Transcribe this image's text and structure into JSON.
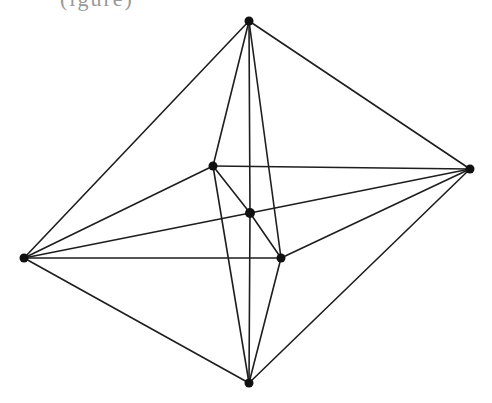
{
  "caption_fragment": "(igure)",
  "colors": {
    "line": "#1e1e1e",
    "vertex": "#111111",
    "background": "#ffffff"
  },
  "graph": {
    "vertices": [
      {
        "id": "top",
        "x": 249,
        "y": 21,
        "r": 4.5
      },
      {
        "id": "right",
        "x": 470,
        "y": 169,
        "r": 4.5
      },
      {
        "id": "left",
        "x": 24,
        "y": 258,
        "r": 4.5
      },
      {
        "id": "bottom",
        "x": 249,
        "y": 383,
        "r": 4.5
      },
      {
        "id": "inner-upper-left",
        "x": 213,
        "y": 166,
        "r": 4.5
      },
      {
        "id": "center",
        "x": 250,
        "y": 213,
        "r": 5
      },
      {
        "id": "inner-lower-right",
        "x": 281,
        "y": 258,
        "r": 4.5
      }
    ],
    "edges": [
      [
        "top",
        "left"
      ],
      [
        "top",
        "right"
      ],
      [
        "bottom",
        "left"
      ],
      [
        "bottom",
        "right"
      ],
      [
        "top",
        "inner-upper-left"
      ],
      [
        "top",
        "center"
      ],
      [
        "top",
        "inner-lower-right"
      ],
      [
        "bottom",
        "inner-upper-left"
      ],
      [
        "bottom",
        "center"
      ],
      [
        "bottom",
        "inner-lower-right"
      ],
      [
        "left",
        "inner-upper-left"
      ],
      [
        "left",
        "center"
      ],
      [
        "left",
        "inner-lower-right"
      ],
      [
        "right",
        "inner-upper-left"
      ],
      [
        "right",
        "center"
      ],
      [
        "right",
        "inner-lower-right"
      ],
      [
        "inner-upper-left",
        "center"
      ],
      [
        "center",
        "inner-lower-right"
      ]
    ]
  }
}
